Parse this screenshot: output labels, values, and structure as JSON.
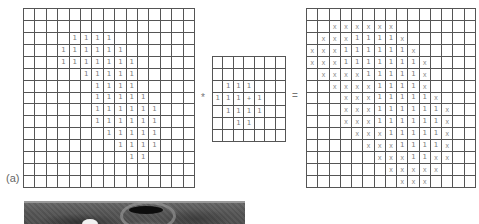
{
  "figure": {
    "panel_label": "(a)",
    "operator_symbol": "*",
    "equals_symbol": "=",
    "cell_symbols": {
      "one": "1",
      "x": "x",
      "center": "+"
    }
  },
  "input_grid": {
    "rows": 15,
    "cols": 15,
    "ones": [
      [
        2,
        [
          4,
          5,
          6,
          7
        ]
      ],
      [
        3,
        [
          3,
          4,
          5,
          6,
          7,
          8
        ]
      ],
      [
        4,
        [
          3,
          4,
          5,
          6,
          7,
          8,
          9
        ]
      ],
      [
        5,
        [
          5,
          6,
          7,
          8,
          9
        ]
      ],
      [
        6,
        [
          6,
          7,
          8,
          9
        ]
      ],
      [
        7,
        [
          6,
          7,
          8,
          9,
          10
        ]
      ],
      [
        8,
        [
          6,
          7,
          8,
          9,
          10,
          11
        ]
      ],
      [
        9,
        [
          6,
          7,
          8,
          9,
          10,
          11
        ]
      ],
      [
        10,
        [
          7,
          8,
          9,
          10,
          11
        ]
      ],
      [
        11,
        [
          8,
          9,
          10,
          11
        ]
      ],
      [
        12,
        [
          9,
          10
        ]
      ]
    ]
  },
  "kernel_grid": {
    "rows": 7,
    "cols": 7,
    "ones": [
      [
        2,
        [
          1,
          2,
          3
        ]
      ],
      [
        3,
        [
          0,
          1,
          2,
          4
        ]
      ],
      [
        4,
        [
          1,
          2,
          3,
          4
        ]
      ],
      [
        5,
        [
          2,
          3
        ]
      ]
    ],
    "center": [
      3,
      3
    ]
  },
  "result_grid": {
    "rows": 15,
    "cols": 15,
    "ones": [
      [
        2,
        [
          4,
          5,
          6,
          7
        ]
      ],
      [
        3,
        [
          3,
          4,
          5,
          6,
          7,
          8
        ]
      ],
      [
        4,
        [
          3,
          4,
          5,
          6,
          7,
          8,
          9
        ]
      ],
      [
        5,
        [
          5,
          6,
          7,
          8,
          9
        ]
      ],
      [
        6,
        [
          6,
          7,
          8,
          9
        ]
      ],
      [
        7,
        [
          6,
          7,
          8,
          9,
          10
        ]
      ],
      [
        8,
        [
          6,
          7,
          8,
          9,
          10,
          11
        ]
      ],
      [
        9,
        [
          6,
          7,
          8,
          9,
          10,
          11
        ]
      ],
      [
        10,
        [
          7,
          8,
          9,
          10,
          11
        ]
      ],
      [
        11,
        [
          8,
          9,
          10,
          11
        ]
      ],
      [
        12,
        [
          9,
          10
        ]
      ]
    ],
    "xs": [
      [
        1,
        [
          2,
          3,
          4,
          5,
          6,
          7
        ]
      ],
      [
        2,
        [
          1,
          2,
          3,
          8
        ]
      ],
      [
        3,
        [
          0,
          1,
          2,
          9
        ]
      ],
      [
        4,
        [
          0,
          1,
          2,
          10
        ]
      ],
      [
        5,
        [
          1,
          2,
          3,
          4,
          10
        ]
      ],
      [
        6,
        [
          2,
          3,
          4,
          5,
          10
        ]
      ],
      [
        7,
        [
          3,
          4,
          5,
          11
        ]
      ],
      [
        8,
        [
          3,
          4,
          5,
          12
        ]
      ],
      [
        9,
        [
          3,
          4,
          5,
          12
        ]
      ],
      [
        10,
        [
          4,
          5,
          6,
          12
        ]
      ],
      [
        11,
        [
          5,
          6,
          7,
          12
        ]
      ],
      [
        12,
        [
          6,
          7,
          8,
          11,
          12
        ]
      ],
      [
        13,
        [
          7,
          8,
          9,
          10,
          11
        ]
      ],
      [
        14,
        [
          8,
          9,
          10
        ]
      ]
    ]
  },
  "photo": {
    "description": "grayscale medical image (partially visible)"
  }
}
